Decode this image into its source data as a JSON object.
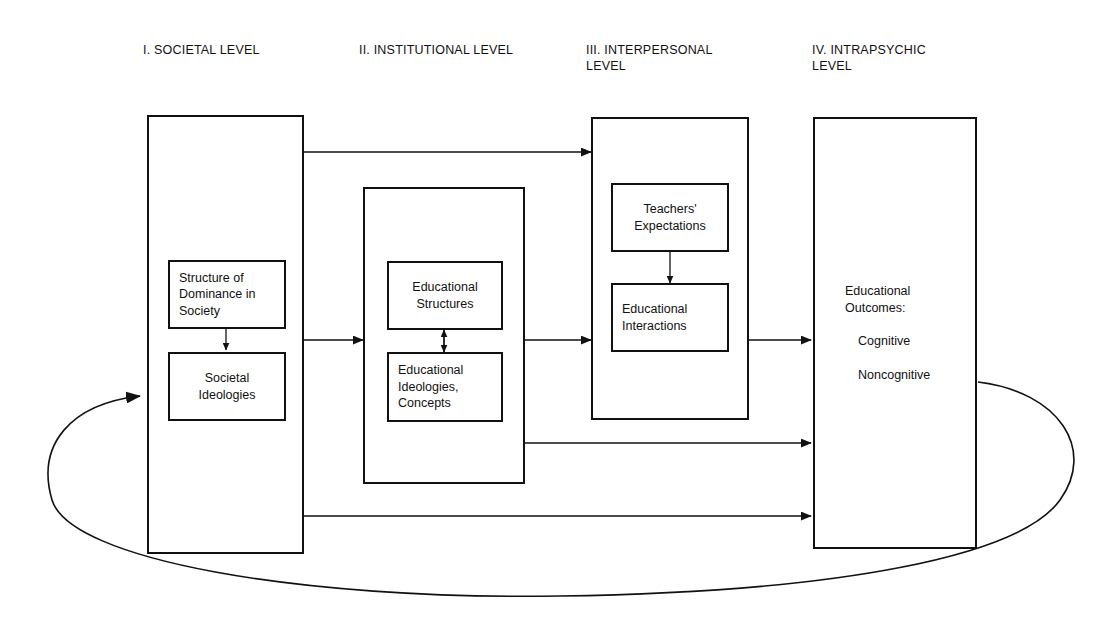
{
  "figure": {
    "background_color": "#ffffff",
    "line_color": "#111111"
  },
  "columns": [
    {
      "id": "societal",
      "title": "I. SOCIETAL LEVEL"
    },
    {
      "id": "institutional",
      "title": "II. INSTITUTIONAL LEVEL"
    },
    {
      "id": "interpersonal",
      "title": "III. INTERPERSONAL\nLEVEL"
    },
    {
      "id": "intrapsychic",
      "title": "IV. INTRAPSYCHIC\nLEVEL"
    }
  ],
  "boxes": {
    "structure_of_dominance": "Structure of\nDominance in\nSociety",
    "societal_ideologies": "Societal\nIdeologies",
    "educational_structures": "Educational\nStructures",
    "educational_ideologies": "Educational\nIdeologies,\nConcepts",
    "teachers_expectations": "Teachers'\nExpectations",
    "educational_interactions": "Educational\nInteractions"
  },
  "outcomes": {
    "heading": "Educational\nOutcomes:",
    "item_1": "Cognitive",
    "item_2": "Noncognitive"
  }
}
